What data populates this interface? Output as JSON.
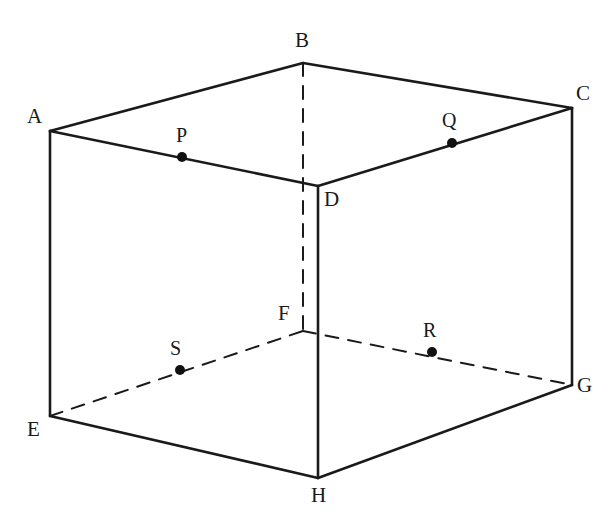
{
  "figure": {
    "type": "geometric-diagram",
    "background_color": "#ffffff",
    "stroke_color": "#1a1a1a",
    "dot_color": "#111111",
    "solid_stroke_width": 2.6,
    "dashed_stroke_width": 2.0,
    "dash_pattern": "13 10",
    "dot_radius": 5,
    "canvas": {
      "width": 616,
      "height": 530
    }
  },
  "vertices": [
    {
      "id": "A",
      "label": "A",
      "x": 50,
      "y": 131,
      "label_x": 27,
      "label_y": 106,
      "hidden": false
    },
    {
      "id": "B",
      "label": "B",
      "x": 303,
      "y": 63,
      "label_x": 295,
      "label_y": 30,
      "hidden": false
    },
    {
      "id": "C",
      "label": "C",
      "x": 572,
      "y": 108,
      "label_x": 576,
      "label_y": 83,
      "hidden": false
    },
    {
      "id": "D",
      "label": "D",
      "x": 318,
      "y": 186,
      "label_x": 324,
      "label_y": 189,
      "hidden": false
    },
    {
      "id": "E",
      "label": "E",
      "x": 50,
      "y": 416,
      "label_x": 27,
      "label_y": 419,
      "hidden": false
    },
    {
      "id": "F",
      "label": "F",
      "x": 303,
      "y": 331,
      "label_x": 278,
      "label_y": 303,
      "hidden": true
    },
    {
      "id": "G",
      "label": "G",
      "x": 572,
      "y": 385,
      "label_x": 577,
      "label_y": 375,
      "hidden": false
    },
    {
      "id": "H",
      "label": "H",
      "x": 318,
      "y": 478,
      "label_x": 311,
      "label_y": 485,
      "hidden": false
    }
  ],
  "marked_points": [
    {
      "id": "P",
      "label": "P",
      "x": 182,
      "y": 157,
      "label_x": 176,
      "label_y": 125,
      "on_edge": "A-D",
      "hidden": false
    },
    {
      "id": "Q",
      "label": "Q",
      "x": 452,
      "y": 143,
      "label_x": 442,
      "label_y": 110,
      "on_edge": "D-C",
      "hidden": false
    },
    {
      "id": "R",
      "label": "R",
      "x": 432,
      "y": 352,
      "label_x": 423,
      "label_y": 320,
      "on_edge": "F-G",
      "hidden": false
    },
    {
      "id": "S",
      "label": "S",
      "x": 180,
      "y": 370,
      "label_x": 170,
      "label_y": 338,
      "on_edge": "E-F",
      "hidden": false
    }
  ],
  "edges": [
    {
      "id": "AB",
      "from": "A",
      "to": "B",
      "style": "solid"
    },
    {
      "id": "BC",
      "from": "B",
      "to": "C",
      "style": "solid"
    },
    {
      "id": "AD",
      "from": "A",
      "to": "D",
      "style": "solid"
    },
    {
      "id": "DC",
      "from": "D",
      "to": "C",
      "style": "solid"
    },
    {
      "id": "AE",
      "from": "A",
      "to": "E",
      "style": "solid"
    },
    {
      "id": "CG",
      "from": "C",
      "to": "G",
      "style": "solid"
    },
    {
      "id": "DH",
      "from": "D",
      "to": "H",
      "style": "solid"
    },
    {
      "id": "BF",
      "from": "B",
      "to": "F",
      "style": "dashed"
    },
    {
      "id": "EH",
      "from": "E",
      "to": "H",
      "style": "solid"
    },
    {
      "id": "HG",
      "from": "H",
      "to": "G",
      "style": "solid"
    },
    {
      "id": "EF",
      "from": "E",
      "to": "F",
      "style": "dashed"
    },
    {
      "id": "FG",
      "from": "F",
      "to": "G",
      "style": "dashed"
    }
  ]
}
